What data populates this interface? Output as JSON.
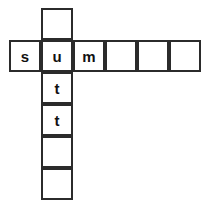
{
  "puzzle": {
    "type": "crossword-grid",
    "background_color": "#ffffff",
    "line_color": "#2b2b2b",
    "text_color": "#111111",
    "cell_size": 32,
    "origin_x": 9,
    "origin_y": 8,
    "columns": 6,
    "rows": 6,
    "across_word": "sum",
    "down_word": "utt",
    "cells": [
      {
        "name": "cell-c1-r0",
        "col": 1,
        "row": 0,
        "letter": "",
        "filled": false
      },
      {
        "name": "cell-c0-r1",
        "col": 0,
        "row": 1,
        "letter": "s",
        "filled": true
      },
      {
        "name": "cell-c1-r1",
        "col": 1,
        "row": 1,
        "letter": "u",
        "filled": true
      },
      {
        "name": "cell-c2-r1",
        "col": 2,
        "row": 1,
        "letter": "m",
        "filled": true
      },
      {
        "name": "cell-c3-r1",
        "col": 3,
        "row": 1,
        "letter": "",
        "filled": false
      },
      {
        "name": "cell-c4-r1",
        "col": 4,
        "row": 1,
        "letter": "",
        "filled": false
      },
      {
        "name": "cell-c5-r1",
        "col": 5,
        "row": 1,
        "letter": "",
        "filled": false
      },
      {
        "name": "cell-c1-r2",
        "col": 1,
        "row": 2,
        "letter": "t",
        "filled": true
      },
      {
        "name": "cell-c1-r3",
        "col": 1,
        "row": 3,
        "letter": "t",
        "filled": true
      },
      {
        "name": "cell-c1-r4",
        "col": 1,
        "row": 4,
        "letter": "",
        "filled": false
      },
      {
        "name": "cell-c1-r5",
        "col": 1,
        "row": 5,
        "letter": "",
        "filled": false
      }
    ]
  }
}
